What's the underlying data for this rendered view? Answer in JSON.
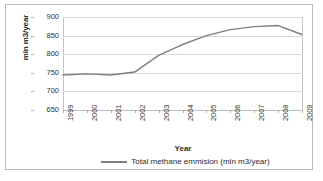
{
  "chart_data": {
    "type": "line",
    "title": "",
    "xlabel": "Year",
    "ylabel": "mln m3/year",
    "categories": [
      "1999",
      "2000",
      "2001",
      "2002",
      "2003",
      "2004",
      "2005",
      "2006",
      "2007",
      "2008",
      "2009"
    ],
    "x": [
      1999,
      2000,
      2001,
      2002,
      2003,
      2004,
      2005,
      2006,
      2007,
      2008,
      2009
    ],
    "series": [
      {
        "name": "Total methane emmision (mln m3/year)",
        "values": [
          744,
          747,
          744,
          752,
          797,
          826,
          850,
          866,
          874,
          877,
          853
        ],
        "color": "#7f7f7f"
      }
    ],
    "ylim": [
      650,
      900
    ],
    "yticks": [
      650,
      700,
      750,
      800,
      850,
      900
    ],
    "ytick_labels": [
      "650",
      "700",
      "750",
      "800",
      "850",
      "900"
    ],
    "grid": "horizontal",
    "legend_position": "bottom",
    "line_color": "#7f7f7f",
    "gridline_color": "#d8d8d8",
    "axis_color": "#c4c4c4",
    "background": "#ffffff"
  },
  "legend": {
    "entries": [
      {
        "label": "Total methane emmision (mln m3/year)"
      }
    ]
  },
  "axes": {
    "y_title": "mln m3/year",
    "x_title": "Year"
  }
}
